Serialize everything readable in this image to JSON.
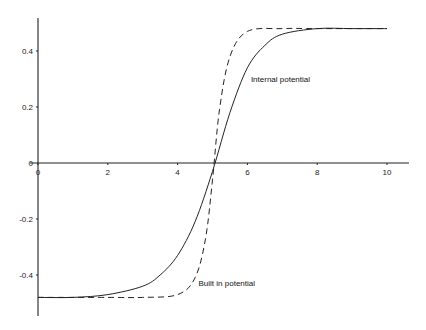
{
  "chart_data": {
    "type": "line",
    "title": "",
    "xlabel": "",
    "ylabel": "",
    "xlim": [
      0,
      10.6
    ],
    "ylim": [
      -0.55,
      0.52
    ],
    "grid": false,
    "x_ticks": [
      "0",
      "2",
      "4",
      "6",
      "8",
      "10"
    ],
    "y_ticks": [
      "0.4",
      "0.2",
      "0",
      "-0.2",
      "-0.4"
    ],
    "series": [
      {
        "name": "Internal potential",
        "style": "solid",
        "x": [
          0,
          1,
          2,
          3,
          3.5,
          4,
          4.5,
          5,
          5.5,
          6,
          6.5,
          7,
          8,
          9,
          10
        ],
        "values": [
          -0.48,
          -0.48,
          -0.47,
          -0.44,
          -0.4,
          -0.33,
          -0.21,
          -0.03,
          0.18,
          0.34,
          0.42,
          0.46,
          0.48,
          0.48,
          0.48
        ]
      },
      {
        "name": "Built in potential",
        "style": "dashed",
        "x": [
          0,
          2,
          3,
          4,
          4.5,
          4.8,
          5,
          5.2,
          5.5,
          6,
          7,
          8,
          10
        ],
        "values": [
          -0.48,
          -0.48,
          -0.48,
          -0.47,
          -0.41,
          -0.27,
          -0.06,
          0.19,
          0.38,
          0.47,
          0.48,
          0.48,
          0.48
        ]
      }
    ],
    "annotations": [
      {
        "text": "Internal potential",
        "x": 6.1,
        "y": 0.29
      },
      {
        "text": "Built in potential",
        "x": 4.6,
        "y": -0.44
      }
    ]
  }
}
